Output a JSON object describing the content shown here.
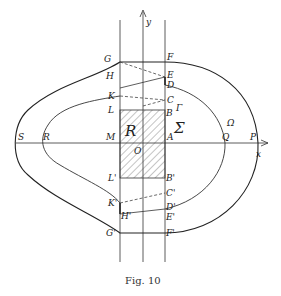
{
  "figure": {
    "caption": "Fig. 10",
    "axes": {
      "x_label": "x",
      "y_label": "y",
      "origin_label": "O"
    },
    "region_labels": {
      "rectangle": "R",
      "inner_region": "Σ",
      "outer_region": "Ω",
      "gamma": "Γ"
    },
    "points_upper": {
      "G": "G",
      "F": "F",
      "H": "H",
      "E": "E",
      "D": "D",
      "K": "K",
      "C": "C",
      "L": "L",
      "B": "B",
      "M": "M",
      "A": "A"
    },
    "points_lower": {
      "L": "L'",
      "B": "B'",
      "C": "C'",
      "K": "K'",
      "D": "D'",
      "H": "H'",
      "E": "E'",
      "G": "G'",
      "F": "F'"
    },
    "points_axis": {
      "S": "S",
      "R": "R",
      "Q": "Q",
      "P": "P"
    },
    "colors": {
      "ink": "#2a2a2a",
      "background": "#ffffff"
    }
  }
}
